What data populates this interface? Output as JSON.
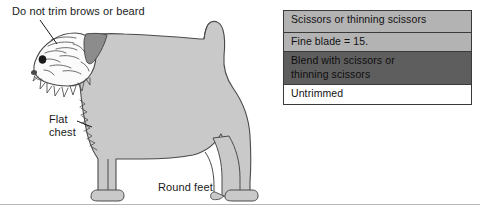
{
  "figure": {
    "background_color": "#ffffff",
    "rule_color": "#b9b9b9"
  },
  "annotations": [
    {
      "id": "brows",
      "text": "Do not trim brows or beard",
      "points_to": "head-brows-and-beard"
    },
    {
      "id": "chest",
      "text": "Flat\nchest",
      "points_to": "dog-chest"
    },
    {
      "id": "feet",
      "text": "Round feet",
      "points_to": "dog-feet"
    }
  ],
  "illustration": {
    "subject": "dog-side-profile",
    "body_fill": "#c9c9c9",
    "head_fill": "#fbfbfb",
    "ear_fill": "#8c8c8c",
    "outline_color": "#4a4a4a",
    "eye_color": "#1a1a1a",
    "parts": [
      "head",
      "beard",
      "brows",
      "ear",
      "eye",
      "neck",
      "back",
      "tail",
      "chest",
      "front-legs",
      "hind-legs",
      "feet"
    ]
  },
  "legend": {
    "border_color": "#3a3a3a",
    "rows": [
      {
        "label": "Scissors or thinning scissors",
        "swatch_color": "#b3b3b3",
        "swatch_name": "light-gray-swatch"
      },
      {
        "label": "Fine blade = 15.",
        "swatch_color": "#b3b3b3",
        "swatch_name": "light-gray-swatch"
      },
      {
        "label": "Blend with scissors or\nthinning scissors",
        "swatch_color": "#5e5e5e",
        "swatch_name": "dark-gray-swatch"
      },
      {
        "label": "Untrimmed",
        "swatch_color": "#ffffff",
        "swatch_name": "white-swatch"
      }
    ]
  }
}
